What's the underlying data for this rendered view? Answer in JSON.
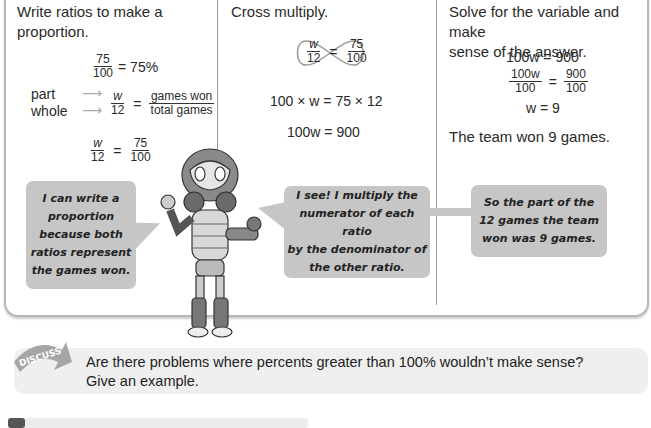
{
  "columns": [
    {
      "heading": "Write ratios to make a proportion.",
      "heading_lines": [
        "Write ratios to make a",
        "proportion."
      ],
      "eq1": {
        "num": "75",
        "den": "100",
        "rhs": "= 75%"
      },
      "labels": {
        "part": "part",
        "whole": "whole"
      },
      "eq2": {
        "num": "w",
        "den": "12",
        "eq": "=",
        "rnum": "games won",
        "rden": "total games"
      },
      "eq3": {
        "num": "w",
        "den": "12",
        "eq": "=",
        "rnum": "75",
        "rden": "100"
      },
      "bubble": [
        "I can write a",
        "proportion",
        "because both",
        "ratios represent",
        "the games won."
      ]
    },
    {
      "heading": "Cross multiply.",
      "cross": {
        "num": "w",
        "den": "12",
        "eq": "=",
        "rnum": "75",
        "rden": "100"
      },
      "line1": "100 × w = 75 × 12",
      "line2": "100w = 900",
      "bubble": [
        "I see! I multiply the",
        "numerator of each ratio",
        "by the denominator of",
        "the other ratio."
      ]
    },
    {
      "heading_lines": [
        "Solve for the variable and make",
        "sense of the answer."
      ],
      "line1": "100w = 900",
      "frac": {
        "num": "100w",
        "den": "100",
        "eq": "=",
        "rnum": "900",
        "rden": "100"
      },
      "line3": "w = 9",
      "answer": "The team won 9 games.",
      "bubble": [
        "So the part of the",
        "12 games the team",
        "won was 9 games."
      ]
    }
  ],
  "discuss": {
    "badge": "DISCUSS",
    "line1": "Are there problems where percents greater than 100% wouldn’t make sense?",
    "line2": "Give an example."
  },
  "colors": {
    "bubble": "#c6c6c6",
    "border": "#b8b8b8",
    "discuss_bg": "#efefef"
  }
}
